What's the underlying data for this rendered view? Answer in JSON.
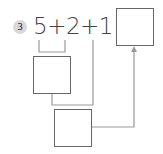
{
  "problem": {
    "number": "3",
    "expression": "5+2+1 =",
    "terms": [
      "5",
      "2",
      "1"
    ],
    "operators": [
      "+",
      "+",
      "="
    ]
  },
  "boxes": [
    {
      "id": "answer-box",
      "value": ""
    },
    {
      "id": "partial-sum-box",
      "value": ""
    },
    {
      "id": "final-sum-box",
      "value": ""
    }
  ],
  "colors": {
    "badge_bg": "#d9d9d9",
    "line": "#999999",
    "box_border": "#666666",
    "text": "#444444"
  }
}
